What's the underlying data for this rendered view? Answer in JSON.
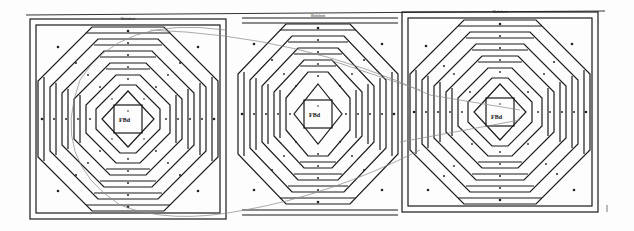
{
  "document": {
    "type": "paper-piecing quilt pattern sheet",
    "pattern_name": "Pineapple block",
    "colors": {
      "paper": "#fdfdfd",
      "ink": "#1a1a1a",
      "stray_line": "#8a8a8a"
    }
  },
  "blocks": [
    {
      "id": "block-left",
      "header": "Worksheet",
      "center_label": "FBd"
    },
    {
      "id": "block-middle",
      "header": "Worksheet",
      "center_label": "FBd"
    },
    {
      "id": "block-right",
      "header": "Worksheet",
      "center_label": "FBd"
    }
  ]
}
